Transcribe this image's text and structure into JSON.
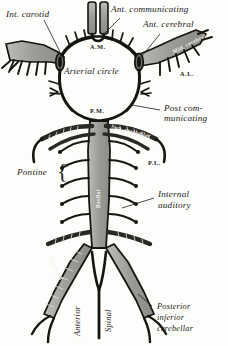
{
  "figure": {
    "title": "Arterial circle",
    "style": "engraving",
    "colors": {
      "background": "#fdfdfb",
      "vessel_fill": "#9a9a98",
      "vessel_fill_light": "#b5b5b2",
      "vessel_outline": "#17150f",
      "ink": "#1c1a18"
    }
  },
  "labels": {
    "int_carotid": "Int. carotid",
    "ant_communicating": "Ant. communicating",
    "ant_cerebral": "Ant. cerebral",
    "arterial_circle": "Arterial circle",
    "post_communicating_l1": "Post com-",
    "post_communicating_l2": "municating",
    "pontine": "Pontine",
    "internal_auditory_l1": "Internal",
    "internal_auditory_l2": "auditory",
    "anterior": "Anterior",
    "spinal": "Spinal",
    "posterior_inferior_cerebellar_l1": "Posterior",
    "posterior_inferior_cerebellar_l2": "inferior",
    "posterior_inferior_cerebellar_l3": "cerebellar",
    "basilar": "Basilar",
    "vertebral": "Vertebral",
    "mid_cerebral": "Mid. cerebral",
    "sup_cerebellar": "Sup. cerebellar",
    "abbr_am": "A.M.",
    "abbr_pm": "P.M.",
    "abbr_al": "A.L.",
    "abbr_pl": "P.L."
  }
}
